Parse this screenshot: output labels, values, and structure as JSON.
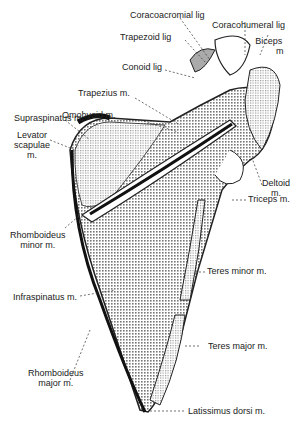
{
  "diagram": {
    "labels": {
      "coracoacromial": "Coracoacromial lig",
      "coracohumeral": "Coracohumeral lig",
      "trapezoid": "Trapezoid lig",
      "biceps1": "Biceps",
      "biceps2": "m",
      "conoid": "Conoid lig",
      "trapezius": "Trapezius m.",
      "omohyoid": "Omohyoid m.",
      "supraspinatus": "Supraspinatus m.",
      "levator1": "Levator",
      "levator2": "scapulae",
      "levator3": "m.",
      "deltoid1": "Deltoid",
      "deltoid2": "m.",
      "triceps": "Triceps m.",
      "rhmin1": "Rhomboideus",
      "rhmin2": "minor m.",
      "teresminor": "Teres minor m.",
      "infraspinatus": "Infraspinatus m.",
      "teresmajor": "Teres major m.",
      "rhmaj1": "Rhomboideus",
      "rhmaj2": "major m.",
      "latissimus": "Latissimus dorsi m."
    }
  }
}
